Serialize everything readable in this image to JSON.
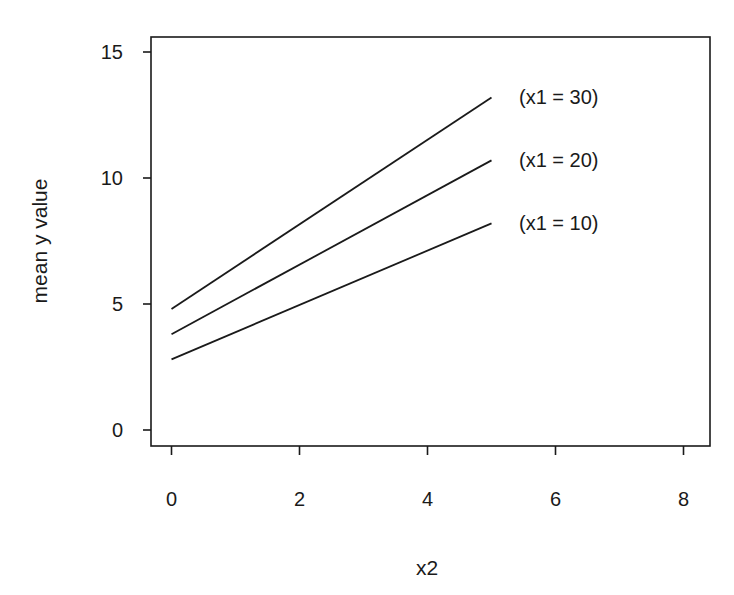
{
  "chart_data": {
    "type": "line",
    "title": "",
    "xlabel": "x2",
    "ylabel": "mean y value",
    "xlim": [
      -0.3,
      8.4
    ],
    "ylim": [
      -0.6,
      15.6
    ],
    "xticks": [
      0,
      2,
      4,
      6,
      8
    ],
    "yticks": [
      0,
      5,
      10,
      15
    ],
    "xtick_labels": [
      "0",
      "2",
      "4",
      "6",
      "8"
    ],
    "ytick_labels": [
      "0",
      "5",
      "10",
      "15"
    ],
    "grid": false,
    "legend": "none (direct line labels at right end of each line)",
    "x": [
      0,
      5
    ],
    "series": [
      {
        "name": "(x1 = 30)",
        "values": [
          4.8,
          13.2
        ]
      },
      {
        "name": "(x1 = 20)",
        "values": [
          3.8,
          10.7
        ]
      },
      {
        "name": "(x1 = 10)",
        "values": [
          2.8,
          8.2
        ]
      }
    ]
  },
  "colors": {
    "line": "#1a1a1a",
    "axis": "#1a1a1a",
    "background": "#ffffff"
  }
}
